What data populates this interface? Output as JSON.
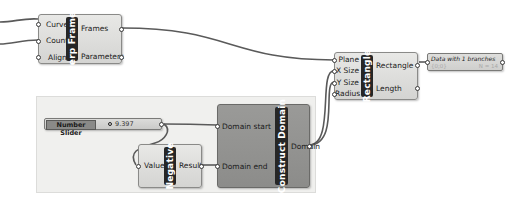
{
  "canvas": {
    "background": "#ffffff",
    "group_color": "#f0f0ee"
  },
  "components": {
    "perp_frames": {
      "title": "Perp Frames",
      "inputs": [
        "Curve",
        "Count",
        "Align"
      ],
      "outputs": [
        "Frames",
        "Parameters"
      ]
    },
    "rectangle": {
      "title": "Rectangle",
      "inputs": [
        "Plane",
        "X Size",
        "Y Size",
        "Radius"
      ],
      "outputs": [
        "Rectangle",
        "Length"
      ]
    },
    "panel": {
      "header": "Data with 1 branches",
      "path": "{0;0}",
      "info": "N = 14"
    },
    "number_slider": {
      "name": "Number Slider",
      "value": "9.397"
    },
    "negative": {
      "title": "Negative",
      "inputs": [
        "Value"
      ],
      "outputs": [
        "Result"
      ]
    },
    "construct_domain": {
      "title": "Construct Domain",
      "inputs": [
        "Domain start",
        "Domain end"
      ],
      "outputs": [
        "Domain"
      ]
    }
  }
}
